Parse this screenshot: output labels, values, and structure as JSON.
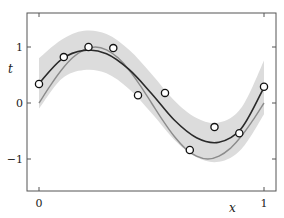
{
  "chart_data": {
    "type": "line",
    "title": "",
    "xlabel": "x",
    "ylabel": "t",
    "xlim": [
      -0.05,
      1.05
    ],
    "ylim": [
      -1.6,
      1.6
    ],
    "xticks": [
      0,
      1
    ],
    "xtick_labels": [
      "0",
      "1"
    ],
    "yticks": [
      -1,
      0,
      1
    ],
    "ytick_labels": [
      "−1",
      "0",
      "1"
    ],
    "grid": false,
    "legend": null,
    "series": [
      {
        "name": "predictive uncertainty band",
        "kind": "area",
        "color": "#dcdcdc",
        "x": [
          0,
          0.1,
          0.2,
          0.3,
          0.4,
          0.5,
          0.6,
          0.7,
          0.8,
          0.9,
          1.0
        ],
        "lower": [
          -0.1,
          0.43,
          0.59,
          0.53,
          0.25,
          -0.18,
          -0.65,
          -0.97,
          -1.05,
          -0.82,
          -0.2
        ],
        "upper": [
          0.8,
          1.13,
          1.29,
          1.23,
          0.95,
          0.52,
          0.05,
          -0.27,
          -0.35,
          -0.08,
          0.76
        ]
      },
      {
        "name": "true function sin(2πx)",
        "kind": "line",
        "color": "#8c8c8c",
        "x": [
          0,
          0.05,
          0.1,
          0.15,
          0.2,
          0.25,
          0.3,
          0.35,
          0.4,
          0.45,
          0.5,
          0.55,
          0.6,
          0.65,
          0.7,
          0.75,
          0.8,
          0.85,
          0.9,
          0.95,
          1.0
        ],
        "y": [
          0,
          0.31,
          0.59,
          0.81,
          0.95,
          1.0,
          0.95,
          0.81,
          0.59,
          0.31,
          0,
          -0.31,
          -0.59,
          -0.81,
          -0.95,
          -1.0,
          -0.95,
          -0.81,
          -0.59,
          -0.31,
          0
        ]
      },
      {
        "name": "predictive mean",
        "kind": "line",
        "color": "#2a2a2a",
        "x": [
          0,
          0.1,
          0.2,
          0.3,
          0.4,
          0.5,
          0.6,
          0.7,
          0.8,
          0.9,
          1.0
        ],
        "y": [
          0.35,
          0.78,
          0.94,
          0.88,
          0.6,
          0.17,
          -0.3,
          -0.62,
          -0.7,
          -0.45,
          0.28
        ]
      },
      {
        "name": "observations",
        "kind": "scatter",
        "marker": "open-circle",
        "color": "#111111",
        "x": [
          0.0,
          0.11,
          0.22,
          0.33,
          0.44,
          0.56,
          0.67,
          0.78,
          0.89,
          1.0
        ],
        "y": [
          0.34,
          0.82,
          1.0,
          0.98,
          0.14,
          0.18,
          -0.84,
          -0.43,
          -0.54,
          0.29
        ]
      }
    ]
  }
}
